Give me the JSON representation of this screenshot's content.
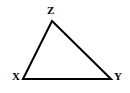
{
  "figure": {
    "kind": "triangle-diagram",
    "background_color": "#ffffff",
    "stroke_color": "#000000",
    "stroke_width": 2,
    "label_color": "#000000",
    "labels": {
      "apex": "Z",
      "bottom_left": "X",
      "bottom_right": "Y"
    },
    "vertices": {
      "z": {
        "x": 52,
        "y": 21
      },
      "x": {
        "x": 23,
        "y": 79
      },
      "y": {
        "x": 111,
        "y": 79
      }
    },
    "polygon_points": "52,21 23,79 111,79"
  }
}
